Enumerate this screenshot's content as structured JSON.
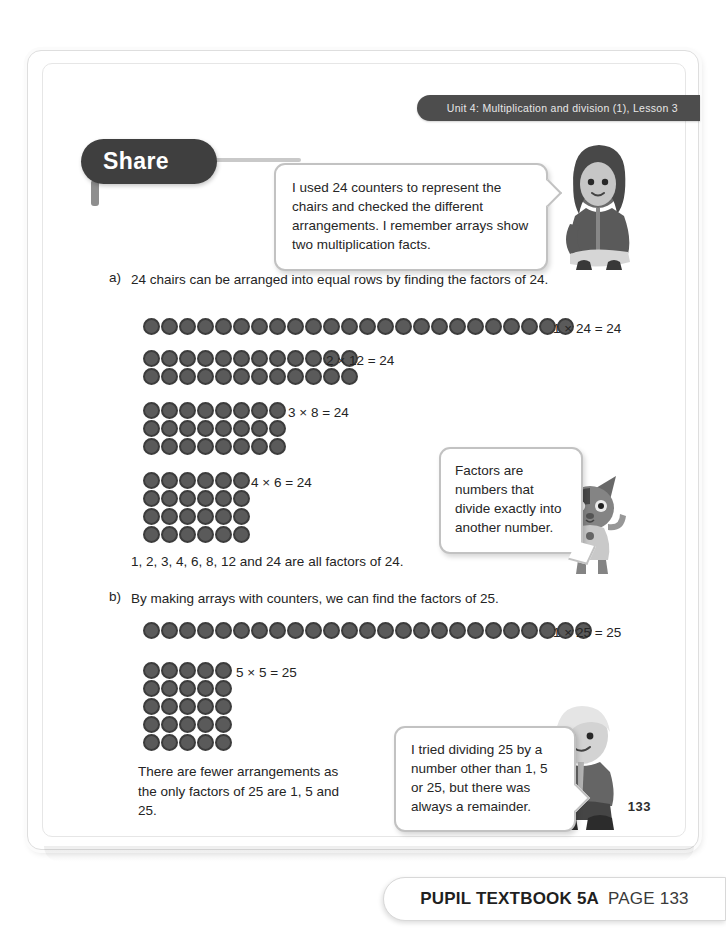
{
  "banner": {
    "unit_text": "Unit 4: Multiplication and division (1), Lesson 3"
  },
  "share": {
    "label": "Share"
  },
  "bubbles": {
    "intro": "I used 24 counters to represent the chairs and checked the different arrangements. I remember arrays show two multiplication facts.",
    "factors": "Factors are numbers that divide exactly into another number.",
    "remainder": "I tried dividing 25 by a number other than 1, 5 or 25, but there was always a remainder."
  },
  "parts": [
    {
      "label": "a)",
      "text": "24 chairs can be arranged into equal rows by finding the factors of 24.",
      "summary": "1, 2, 3, 4, 6, 8, 12 and 24 are all factors of 24."
    },
    {
      "label": "b)",
      "text": "By making arrays with counters, we can find the factors of 25.",
      "summary": "There are fewer arrangements as the only factors of 25 are 1, 5 and 25."
    }
  ],
  "arrays": [
    {
      "id": "a1",
      "rows": 1,
      "cols": 24,
      "equation": "1 × 24 = 24"
    },
    {
      "id": "a2",
      "rows": 2,
      "cols": 12,
      "equation": "2 × 12 = 24"
    },
    {
      "id": "a3",
      "rows": 3,
      "cols": 8,
      "equation": "3 × 8 = 24"
    },
    {
      "id": "a4",
      "rows": 4,
      "cols": 6,
      "equation": "4 × 6 = 24"
    },
    {
      "id": "b1",
      "rows": 1,
      "cols": 25,
      "equation": "1 × 25 = 25"
    },
    {
      "id": "b2",
      "rows": 5,
      "cols": 5,
      "equation": "5 × 5 = 25"
    }
  ],
  "characters": [
    {
      "name": "girl-character",
      "description": "girl sitting"
    },
    {
      "name": "cat-character",
      "description": "cat standing"
    },
    {
      "name": "boy-character",
      "description": "boy crouching"
    }
  ],
  "page_number": "133",
  "footer": {
    "book": "PUPIL TEXTBOOK 5A",
    "page": "PAGE 133"
  },
  "colors": {
    "banner_bg": "#4d4d4d",
    "share_bg": "#3f3f3f",
    "counter_fill": "#5a5a5a",
    "counter_ring": "#3c3c3c",
    "bubble_border": "#c2c2c2",
    "text": "#242424"
  }
}
